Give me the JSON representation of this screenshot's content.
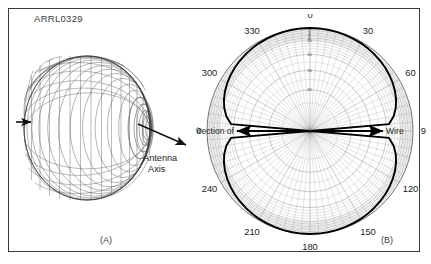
{
  "figure": {
    "id_label": "ARRL0329",
    "panel_a_label": "(A)",
    "panel_b_label": "(B)",
    "border_color": "#3a3a3a",
    "background": "#ffffff"
  },
  "panel_a": {
    "caption": "(A)",
    "annotation_line1": "Antenna",
    "annotation_line2": "Axis",
    "description": "Three-dimensional wire-mesh doughnut (toroidal) radiation pattern of a dipole, viewed from the side with the antenna axis drawn through its center.",
    "mesh_color": "#4a4a4a",
    "arrow_color": "#111111"
  },
  "panel_b": {
    "caption": "(B)",
    "left_annotation": "Direction of",
    "right_annotation": "Wire",
    "center": {
      "x": 114,
      "y": 117
    },
    "outer_radius": 103,
    "plot_color": "#000000",
    "grid_color": "#8e8e8e",
    "chart_data": {
      "type": "line",
      "subtype": "polar",
      "title": "",
      "xlabel": "",
      "ylabel": "",
      "grid": true,
      "legend": null,
      "angle_unit": "degrees",
      "angle_tick_labels": [
        "0",
        "30",
        "60",
        "90",
        "120",
        "150",
        "180",
        "210",
        "240",
        "270",
        "300",
        "330"
      ],
      "angle_tick_values": [
        0,
        30,
        60,
        90,
        120,
        150,
        180,
        210,
        240,
        270,
        300,
        330
      ],
      "angle_minor_step": 5,
      "radial_unit": "dB down from maximum",
      "radial_tick_labels": [
        "2",
        "4",
        "6",
        "8",
        "10",
        "20",
        "30",
        "40",
        "50"
      ],
      "radial_tick_values": [
        2,
        4,
        6,
        8,
        10,
        20,
        30,
        40,
        50
      ],
      "radial_scale": "ARRL log-periodic dB scale",
      "rlim": [
        0,
        50
      ],
      "series": [
        {
          "name": "Dipole azimuth pattern",
          "theta": [
            0,
            5,
            10,
            15,
            20,
            25,
            30,
            35,
            40,
            45,
            50,
            55,
            60,
            65,
            70,
            75,
            80,
            85,
            90,
            95,
            100,
            105,
            110,
            115,
            120,
            125,
            130,
            135,
            140,
            145,
            150,
            155,
            160,
            165,
            170,
            175,
            180,
            185,
            190,
            195,
            200,
            205,
            210,
            215,
            220,
            225,
            230,
            235,
            240,
            245,
            250,
            255,
            260,
            265,
            270,
            275,
            280,
            285,
            290,
            295,
            300,
            305,
            310,
            315,
            320,
            325,
            330,
            335,
            340,
            345,
            350,
            355
          ],
          "r_db_down": [
            0,
            0.03,
            0.13,
            0.3,
            0.54,
            0.85,
            1.25,
            1.74,
            2.32,
            3.01,
            3.84,
            4.81,
            5.97,
            7.37,
            9.08,
            11.24,
            14.07,
            18.1,
            50,
            18.1,
            14.07,
            11.24,
            9.08,
            7.37,
            5.97,
            4.81,
            3.84,
            3.01,
            2.32,
            1.74,
            1.25,
            0.85,
            0.54,
            0.3,
            0.13,
            0.03,
            0,
            0.03,
            0.13,
            0.3,
            0.54,
            0.85,
            1.25,
            1.74,
            2.32,
            3.01,
            3.84,
            4.81,
            5.97,
            7.37,
            9.08,
            11.24,
            14.07,
            18.1,
            50,
            18.1,
            14.07,
            11.24,
            9.08,
            7.37,
            5.97,
            4.81,
            3.84,
            3.01,
            2.32,
            1.74,
            1.25,
            0.85,
            0.54,
            0.3,
            0.13,
            0.03
          ]
        }
      ],
      "annotations": [
        {
          "text": "Direction of",
          "position": "left-of-center",
          "arrow": "left"
        },
        {
          "text": "Wire",
          "position": "right-of-center",
          "arrow": "right"
        }
      ]
    }
  }
}
